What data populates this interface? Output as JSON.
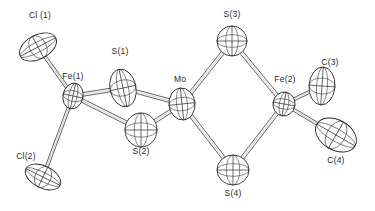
{
  "figure": {
    "kind": "ortep-thermal-ellipsoid-plot",
    "background_color": "#ffffff",
    "line_color": "#2b2b2b",
    "label_color": "#2a2a2a"
  },
  "atoms": [
    {
      "id": "Cl1",
      "label": "Cl (1)",
      "element": "Cl",
      "x": 38,
      "y": 47,
      "label_x": 40,
      "label_y": 16,
      "rx": 20,
      "ry": 12,
      "rot": -28,
      "shade": "light"
    },
    {
      "id": "Fe1",
      "label": "Fe(1)",
      "element": "Fe",
      "x": 73,
      "y": 96,
      "label_x": 73,
      "label_y": 77,
      "rx": 10,
      "ry": 13,
      "rot": 12,
      "shade": "none"
    },
    {
      "id": "Cl2",
      "label": "Cl(2)",
      "element": "Cl",
      "x": 43,
      "y": 177,
      "label_x": 26,
      "label_y": 157,
      "rx": 19,
      "ry": 11,
      "rot": 26,
      "shade": "light"
    },
    {
      "id": "S1",
      "label": "S(1)",
      "element": "S",
      "x": 123,
      "y": 88,
      "label_x": 120,
      "label_y": 52,
      "rx": 13,
      "ry": 19,
      "rot": -12,
      "shade": "stipple"
    },
    {
      "id": "S2",
      "label": "S(2)",
      "element": "S",
      "x": 141,
      "y": 130,
      "label_x": 141,
      "label_y": 152,
      "rx": 16,
      "ry": 17,
      "rot": 0,
      "shade": "stipple"
    },
    {
      "id": "Mo",
      "label": "Mo",
      "element": "Mo",
      "x": 182,
      "y": 104,
      "label_x": 180,
      "label_y": 80,
      "rx": 13,
      "ry": 16,
      "rot": -6,
      "shade": "stipple"
    },
    {
      "id": "S3",
      "label": "S(3)",
      "element": "S",
      "x": 232,
      "y": 41,
      "label_x": 232,
      "label_y": 15,
      "rx": 15,
      "ry": 15,
      "rot": 0,
      "shade": "stipple"
    },
    {
      "id": "S4",
      "label": "S(4)",
      "element": "S",
      "x": 233,
      "y": 170,
      "label_x": 233,
      "label_y": 194,
      "rx": 16,
      "ry": 15,
      "rot": 0,
      "shade": "stipple"
    },
    {
      "id": "Fe2",
      "label": "Fe(2)",
      "element": "Fe",
      "x": 284,
      "y": 104,
      "label_x": 285,
      "label_y": 80,
      "rx": 11,
      "ry": 12,
      "rot": 10,
      "shade": "stipple"
    },
    {
      "id": "C3",
      "label": "C(3)",
      "element": "C",
      "x": 322,
      "y": 86,
      "label_x": 330,
      "label_y": 63,
      "rx": 13,
      "ry": 19,
      "rot": 4,
      "shade": "hatch"
    },
    {
      "id": "C4",
      "label": "C(4)",
      "element": "C",
      "x": 336,
      "y": 135,
      "label_x": 336,
      "label_y": 161,
      "rx": 22,
      "ry": 15,
      "rot": 30,
      "shade": "hatch"
    }
  ],
  "bonds": [
    {
      "id": "b1",
      "from": "Fe1",
      "to": "Cl1",
      "width": 3.0
    },
    {
      "id": "b2",
      "from": "Fe1",
      "to": "Cl2",
      "width": 3.0
    },
    {
      "id": "b3",
      "from": "Fe1",
      "to": "S1",
      "width": 3.6
    },
    {
      "id": "b4",
      "from": "Fe1",
      "to": "S2",
      "width": 3.6
    },
    {
      "id": "b5",
      "from": "S1",
      "to": "Mo",
      "width": 3.6
    },
    {
      "id": "b6",
      "from": "S2",
      "to": "Mo",
      "width": 3.6
    },
    {
      "id": "b7",
      "from": "Mo",
      "to": "S3",
      "width": 3.6
    },
    {
      "id": "b8",
      "from": "Mo",
      "to": "S4",
      "width": 3.6
    },
    {
      "id": "b9",
      "from": "S3",
      "to": "Fe2",
      "width": 3.6
    },
    {
      "id": "b10",
      "from": "S4",
      "to": "Fe2",
      "width": 3.6
    },
    {
      "id": "b11",
      "from": "Fe2",
      "to": "C3",
      "width": 3.0
    },
    {
      "id": "b12",
      "from": "Fe2",
      "to": "C4",
      "width": 3.0
    }
  ]
}
